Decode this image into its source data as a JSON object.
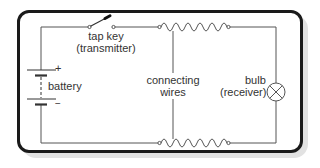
{
  "diagram": {
    "type": "circuit",
    "labels": {
      "tap_key_line1": "tap key",
      "tap_key_line2": "(transmitter)",
      "battery": "battery",
      "battery_plus": "+",
      "battery_minus": "−",
      "connecting_line1": "connecting",
      "connecting_line2": "wires",
      "bulb_line1": "bulb",
      "bulb_line2": "(receiver)"
    },
    "components": [
      {
        "id": "battery",
        "symbol": "cell-pair",
        "position": "left"
      },
      {
        "id": "tap-key",
        "symbol": "switch",
        "position": "top-left",
        "state": "open"
      },
      {
        "id": "connecting-wire-top",
        "symbol": "coiled-wire",
        "position": "top"
      },
      {
        "id": "connecting-wire-bottom",
        "symbol": "coiled-wire",
        "position": "bottom"
      },
      {
        "id": "bulb",
        "symbol": "lamp",
        "position": "right"
      }
    ],
    "colors": {
      "line": "#555555",
      "frame": "#1a1a1a",
      "shadow": "#e2e2e2"
    }
  }
}
